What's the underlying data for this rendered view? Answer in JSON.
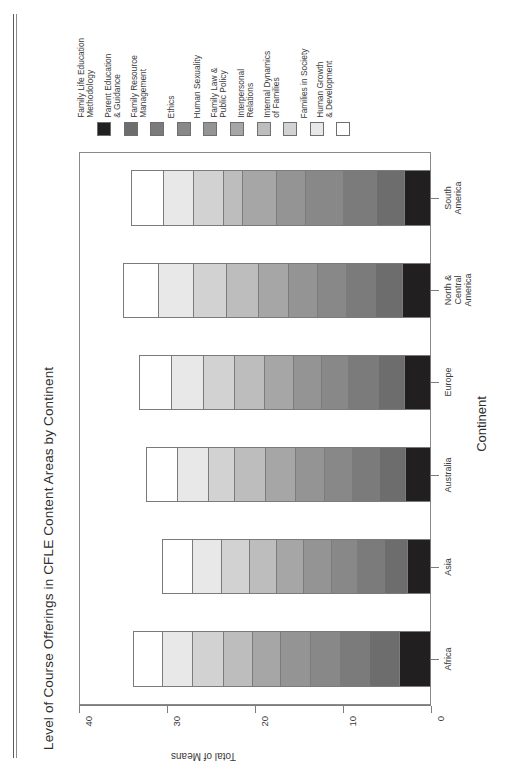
{
  "figure": {
    "caption": "Figure 13.2",
    "title": "Level of Course Offerings in CFLE Content Areas by Continent"
  },
  "legend": {
    "items": [
      {
        "label_line1": "Family Life Education",
        "label_line2": "Methodology",
        "color": "#211f1f"
      },
      {
        "label_line1": "Parent Education",
        "label_line2": "& Guidance",
        "color": "#6d6d6d"
      },
      {
        "label_line1": "Family Resource",
        "label_line2": "Management",
        "color": "#7b7b7b"
      },
      {
        "label_line1": "Ethics",
        "label_line2": "",
        "color": "#888888"
      },
      {
        "label_line1": "Human Sexuality",
        "label_line2": "",
        "color": "#949494"
      },
      {
        "label_line1": "Family Law &",
        "label_line2": "Public Policy",
        "color": "#a6a6a6"
      },
      {
        "label_line1": "Interpersonal",
        "label_line2": "Relations",
        "color": "#bdbdbd"
      },
      {
        "label_line1": "Internal Dynamics",
        "label_line2": "of Families",
        "color": "#d2d2d2"
      },
      {
        "label_line1": "Families in Society",
        "label_line2": "",
        "color": "#e8e8e8"
      },
      {
        "label_line1": "Human Growth",
        "label_line2": "& Development",
        "color": "#ffffff"
      }
    ]
  },
  "chart_data": {
    "type": "bar",
    "orientation": "horizontal-stacked",
    "title": "Level of Course Offerings in CFLE Content Areas by Continent",
    "xlabel": "Continent",
    "ylabel": "Total of Means",
    "ylim": [
      0,
      40
    ],
    "yticks": [
      0,
      10,
      20,
      30,
      40
    ],
    "grid": false,
    "legend_position": "top",
    "categories": [
      "Africa",
      "Asia",
      "Australia",
      "Europe",
      "North & Central America",
      "South America"
    ],
    "series": [
      {
        "name": "Family Life Education Methodology",
        "color": "#211f1f",
        "values": [
          3.6,
          2.7,
          3.0,
          3.1,
          3.3,
          3.1
        ]
      },
      {
        "name": "Parent Education & Guidance",
        "color": "#6d6d6d",
        "values": [
          3.4,
          2.7,
          2.9,
          2.9,
          3.1,
          3.1
        ]
      },
      {
        "name": "Family Resource Management",
        "color": "#7b7b7b",
        "values": [
          3.4,
          3.0,
          3.1,
          3.4,
          3.3,
          3.8
        ]
      },
      {
        "name": "Ethics",
        "color": "#888888",
        "values": [
          3.4,
          3.0,
          3.2,
          3.1,
          3.3,
          4.3
        ]
      },
      {
        "name": "Human Sexuality",
        "color": "#949494",
        "values": [
          3.4,
          3.1,
          3.3,
          3.2,
          3.2,
          3.3
        ]
      },
      {
        "name": "Family Law & Public Policy",
        "color": "#a6a6a6",
        "values": [
          3.2,
          3.1,
          3.4,
          3.3,
          3.5,
          3.9
        ]
      },
      {
        "name": "Interpersonal Relations",
        "color": "#bdbdbd",
        "values": [
          3.3,
          3.1,
          3.5,
          3.4,
          3.6,
          2.2
        ]
      },
      {
        "name": "Internal Dynamics of Families",
        "color": "#d2d2d2",
        "values": [
          3.5,
          3.2,
          3.0,
          3.5,
          3.8,
          3.4
        ]
      },
      {
        "name": "Families in Society",
        "color": "#e8e8e8",
        "values": [
          3.4,
          3.3,
          3.5,
          3.6,
          3.9,
          3.4
        ]
      },
      {
        "name": "Human Growth & Development",
        "color": "#ffffff",
        "values": [
          3.3,
          3.4,
          3.5,
          3.7,
          4.0,
          3.6
        ]
      }
    ],
    "totals": [
      33.9,
      30.6,
      32.4,
      33.2,
      35.0,
      34.1
    ]
  }
}
